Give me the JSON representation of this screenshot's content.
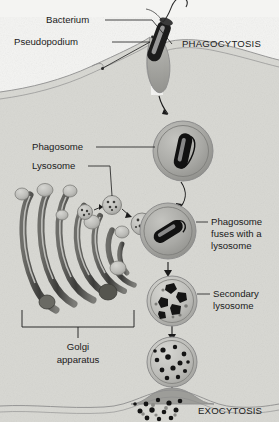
{
  "figure": {
    "background_color": "#ffffff",
    "cytoplasm_color": "#d9d9d4",
    "exterior_color": "#f2f2f0",
    "membrane_color": "#8d8d8d",
    "vesicle_fill": "#a8a8a4",
    "vesicle_light_fill": "#c9c9c5",
    "bacterium_color": "#1c1c1c",
    "debris_color": "#1c1c1c",
    "label_color": "#1a1a1a",
    "leader_color": "#1a1a1a"
  },
  "labels": {
    "bacterium": "Bacterium",
    "pseudopodium": "Pseudopodium",
    "phagocytosis": "PHAGOCYTOSIS",
    "phagosome": "Phagosome",
    "lysosome": "Lysosome",
    "golgi_line1": "Golgi",
    "golgi_line2": "apparatus",
    "fusion_line1": "Phagosome",
    "fusion_line2": "fuses with a",
    "fusion_line3": "lysosome",
    "secondary_line1": "Secondary",
    "secondary_line2": "lysosome",
    "exocytosis": "EXOCYTOSIS"
  },
  "stages": [
    {
      "id": "engulfment",
      "name": "Bacterium captured by pseudopodia at the cell surface"
    },
    {
      "id": "phagosome",
      "name": "Phagosome containing intact bacterium"
    },
    {
      "id": "fusion",
      "name": "Phagosome fuses with a lysosome from the Golgi"
    },
    {
      "id": "secondary-lysosome",
      "name": "Secondary lysosome with partly digested bacterium"
    },
    {
      "id": "residual-body",
      "name": "Residual body containing indigestible debris"
    },
    {
      "id": "exocytosis",
      "name": "Residual debris expelled from the cell"
    }
  ],
  "organelles": {
    "golgi_cisternae_count": 7,
    "golgi_vesicles_count": 9,
    "lysosome_transport_vesicles": 3
  }
}
